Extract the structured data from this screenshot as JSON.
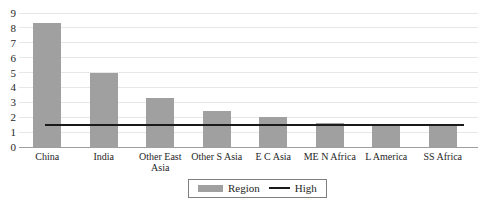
{
  "chart_data": {
    "type": "bar",
    "title": "",
    "xlabel": "",
    "ylabel": "",
    "categories": [
      "China",
      "India",
      "Other East Asia",
      "Other S Asia",
      "E C Asia",
      "ME N Africa",
      "L America",
      "SS Africa"
    ],
    "series": [
      {
        "name": "Region",
        "type": "bar",
        "values": [
          8.3,
          5.0,
          3.3,
          2.4,
          2.0,
          1.6,
          1.5,
          1.4
        ],
        "color": "#a0a0a0"
      },
      {
        "name": "High",
        "type": "line",
        "values": [
          1.5,
          1.5,
          1.5,
          1.5,
          1.5,
          1.5,
          1.5,
          1.5
        ],
        "color": "#1a1a1a"
      }
    ],
    "ylim": [
      0,
      9
    ],
    "yticks": [
      0,
      1,
      2,
      3,
      4,
      5,
      6,
      7,
      8,
      9
    ],
    "grid": "horizontal",
    "legend_position": "bottom-center",
    "legend_entries": [
      "Region",
      "High"
    ]
  },
  "colors": {
    "bar": "#a0a0a0",
    "high_line": "#1a1a1a",
    "gridline": "#e7e7e7",
    "axis": "#9e9e9e",
    "text": "#262626",
    "legend_border": "#7f7f7f",
    "background": "#ffffff"
  }
}
